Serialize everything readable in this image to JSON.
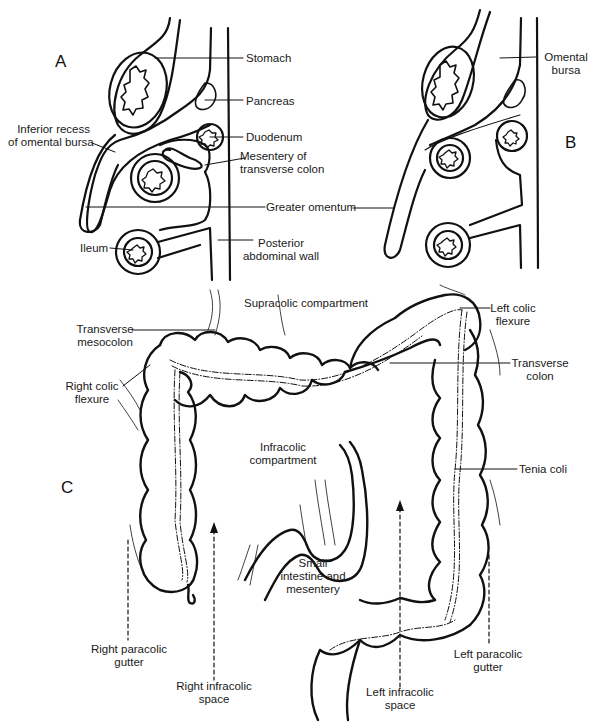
{
  "panels": {
    "a": {
      "letter": "A",
      "labels": {
        "stomach": "Stomach",
        "pancreas": "Pancreas",
        "inferior_recess_1": "Inferior recess",
        "inferior_recess_2": "of omental bursa",
        "duodenum": "Duodenum",
        "mesentery_1": "Mesentery of",
        "mesentery_2": "transverse colon",
        "greater_omentum": "Greater omentum",
        "ileum": "Ileum",
        "posterior_wall_1": "Posterior",
        "posterior_wall_2": "abdominal wall"
      }
    },
    "b": {
      "letter": "B",
      "labels": {
        "omental_bursa_1": "Omental",
        "omental_bursa_2": "bursa"
      }
    },
    "c": {
      "letter": "C",
      "labels": {
        "supracolic": "Supracolic compartment",
        "transverse_mesocolon_1": "Transverse",
        "transverse_mesocolon_2": "mesocolon",
        "left_colic_flexure_1": "Left colic",
        "left_colic_flexure_2": "flexure",
        "right_colic_flexure_1": "Right colic",
        "right_colic_flexure_2": "flexure",
        "transverse_colon_1": "Transverse",
        "transverse_colon_2": "colon",
        "infracolic_1": "Infracolic",
        "infracolic_2": "compartment",
        "tenia_coli": "Tenia coli",
        "small_intestine_1": "Small",
        "small_intestine_2": "intestine and",
        "small_intestine_3": "mesentery",
        "right_paracolic_1": "Right paracolic",
        "right_paracolic_2": "gutter",
        "right_infracolic_1": "Right infracolic",
        "right_infracolic_2": "space",
        "left_infracolic_1": "Left infracolic",
        "left_infracolic_2": "space",
        "left_paracolic_1": "Left paracolic",
        "left_paracolic_2": "gutter"
      }
    }
  }
}
